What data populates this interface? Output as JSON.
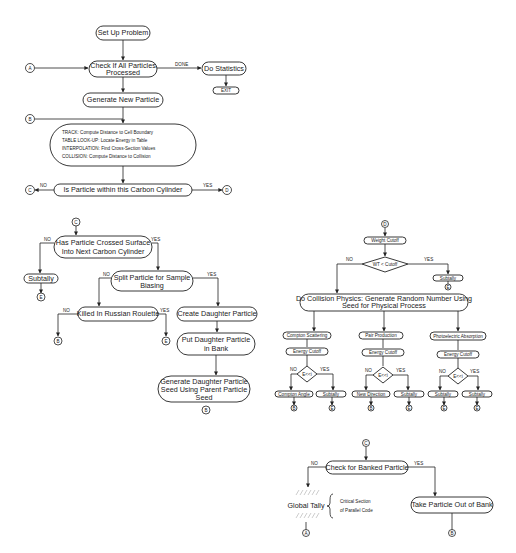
{
  "flowchart_main": {
    "nodes": {
      "setup": "Set Up Problem",
      "check_all_1": "Check If All Particles",
      "check_all_2": "Processed",
      "do_stats": "Do Statistics",
      "exit": "EXIT",
      "gen_new": "Generate New Particle",
      "track_1": "TRACK: Compute Distance to Cell Boundary",
      "track_2": "TABLE LOOK-UP: Locate Energy in Table",
      "track_3": "INTERPOLATION: Find Cross-Section Values",
      "track_4": "COLLISION: Compute Distance to Collision",
      "within_cyl": "Is Particle within this Carbon Cylinder"
    },
    "labels": {
      "done": "DONE",
      "no": "NO",
      "yes": "YES"
    },
    "connectors": {
      "a": "A",
      "b": "B",
      "c": "C",
      "d": "D"
    }
  },
  "flowchart_c": {
    "nodes": {
      "crossed_1": "Has Particle Crossed Surface",
      "crossed_2": "Into Next Carbon Cylinder",
      "subtally": "Subtally",
      "split_1": "Split Particle for Sample",
      "split_2": "Biasing",
      "killed": "Killed In Russian Roulette",
      "create_daughter": "Create Daughter Particle",
      "put_daughter_1": "Put Daughter Particle",
      "put_daughter_2": "in Bank",
      "gen_seed_1": "Generate Daughter Particle",
      "gen_seed_2": "Seed Using Parent Particle",
      "gen_seed_3": "Seed"
    },
    "labels": {
      "no": "NO",
      "yes": "YES"
    },
    "connectors": {
      "c": "C",
      "e": "E",
      "b": "B"
    }
  },
  "flowchart_d": {
    "nodes": {
      "weight_cutoff": "Weight Cutoff",
      "wt_decision": "WT < Cutoff",
      "subtally": "Subtally",
      "collision_1": "Do Collision Physics: Generate Random Number Using",
      "collision_2": "Seed for Physical Process",
      "compton": "Compton Scattering",
      "pair": "Pair Production",
      "photo": "Photoelectric Absorption",
      "energy_cutoff": "Energy Cutoff",
      "e_decision": "E<<i",
      "compton_angle": "Compton Angle",
      "new_direction": "New Direction"
    },
    "labels": {
      "no": "NO",
      "yes": "YES"
    },
    "connectors": {
      "d": "D",
      "e": "E",
      "b": "B"
    }
  },
  "flowchart_bank": {
    "nodes": {
      "check_bank": "Check for Banked Particle",
      "global_tally": "Global Tally",
      "critical_1": "Critical Section",
      "critical_2": "of Parallel Code",
      "take_out": "Take Particle Out of Bank"
    },
    "labels": {
      "no": "NO",
      "yes": "YES"
    },
    "connectors": {
      "c": "C",
      "a": "A",
      "b": "B"
    }
  }
}
